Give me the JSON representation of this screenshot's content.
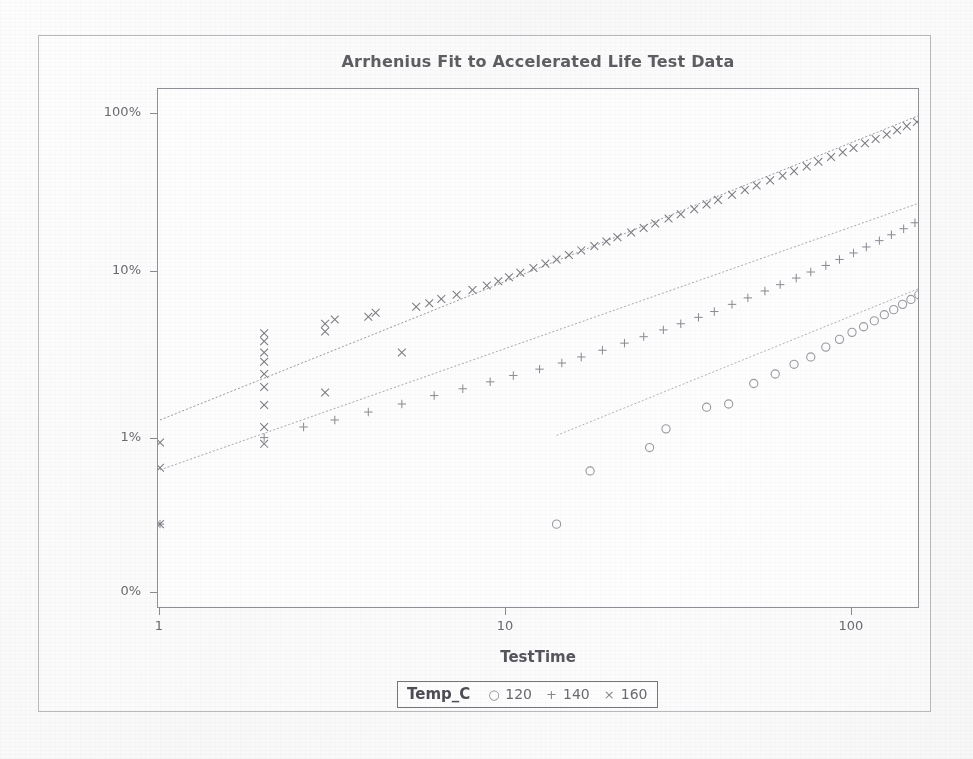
{
  "chart_data": {
    "type": "scatter",
    "title": "Arrhenius Fit to Accelerated Life Test Data",
    "xlabel": "TestTime",
    "ylabel": "Percent Failed",
    "xscale": "log",
    "yscale": "lognormal-probability",
    "xlim": [
      1,
      200
    ],
    "ylim_percent": [
      0.1,
      130
    ],
    "xticks": [
      "1",
      "10",
      "100"
    ],
    "xtick_values": [
      1,
      10,
      100
    ],
    "yticks": [
      "100%",
      "10%",
      "1%",
      "0%"
    ],
    "ytick_values": [
      100,
      10,
      1,
      0.1
    ],
    "grid": false,
    "legend_position": "bottom-center",
    "legend_title": "Temp_C",
    "series": [
      {
        "name": "120",
        "label": "120",
        "marker": "circle",
        "color": "#9a9aa0",
        "fit_line": {
          "x_start": 14.0,
          "y_start": 1.05,
          "x_end": 200.0,
          "y_end": 9.8
        },
        "points": [
          {
            "x": 14.0,
            "y": 0.28
          },
          {
            "x": 17.5,
            "y": 0.62
          },
          {
            "x": 26.0,
            "y": 0.88
          },
          {
            "x": 29.0,
            "y": 1.15
          },
          {
            "x": 38.0,
            "y": 1.55
          },
          {
            "x": 44.0,
            "y": 1.62
          },
          {
            "x": 52.0,
            "y": 2.15
          },
          {
            "x": 60.0,
            "y": 2.45
          },
          {
            "x": 68.0,
            "y": 2.8
          },
          {
            "x": 76.0,
            "y": 3.1
          },
          {
            "x": 84.0,
            "y": 3.55
          },
          {
            "x": 92.0,
            "y": 3.95
          },
          {
            "x": 100.0,
            "y": 4.35
          },
          {
            "x": 108.0,
            "y": 4.7
          },
          {
            "x": 116.0,
            "y": 5.1
          },
          {
            "x": 124.0,
            "y": 5.55
          },
          {
            "x": 132.0,
            "y": 5.95
          },
          {
            "x": 140.0,
            "y": 6.4
          },
          {
            "x": 148.0,
            "y": 6.85
          },
          {
            "x": 156.0,
            "y": 7.3
          },
          {
            "x": 163.0,
            "y": 7.7
          },
          {
            "x": 170.0,
            "y": 8.1
          },
          {
            "x": 177.0,
            "y": 8.5
          },
          {
            "x": 184.0,
            "y": 8.9
          },
          {
            "x": 190.0,
            "y": 9.25
          },
          {
            "x": 196.0,
            "y": 9.6
          }
        ]
      },
      {
        "name": "140",
        "label": "140",
        "marker": "plus",
        "color": "#8e8e95",
        "fit_line": {
          "x_start": 1.0,
          "y_start": 0.63,
          "x_end": 200.0,
          "y_end": 33.0
        },
        "points": [
          {
            "x": 1.0,
            "y": 0.28
          },
          {
            "x": 2.0,
            "y": 1.02
          },
          {
            "x": 2.6,
            "y": 1.18
          },
          {
            "x": 3.2,
            "y": 1.3
          },
          {
            "x": 4.0,
            "y": 1.45
          },
          {
            "x": 5.0,
            "y": 1.62
          },
          {
            "x": 6.2,
            "y": 1.82
          },
          {
            "x": 7.5,
            "y": 2.0
          },
          {
            "x": 9.0,
            "y": 2.2
          },
          {
            "x": 10.5,
            "y": 2.4
          },
          {
            "x": 12.5,
            "y": 2.62
          },
          {
            "x": 14.5,
            "y": 2.85
          },
          {
            "x": 16.5,
            "y": 3.1
          },
          {
            "x": 19.0,
            "y": 3.4
          },
          {
            "x": 22.0,
            "y": 3.75
          },
          {
            "x": 25.0,
            "y": 4.1
          },
          {
            "x": 28.5,
            "y": 4.5
          },
          {
            "x": 32.0,
            "y": 4.9
          },
          {
            "x": 36.0,
            "y": 5.35
          },
          {
            "x": 40.0,
            "y": 5.8
          },
          {
            "x": 45.0,
            "y": 6.4
          },
          {
            "x": 50.0,
            "y": 7.0
          },
          {
            "x": 56.0,
            "y": 7.7
          },
          {
            "x": 62.0,
            "y": 8.4
          },
          {
            "x": 69.0,
            "y": 9.2
          },
          {
            "x": 76.0,
            "y": 10.0
          },
          {
            "x": 84.0,
            "y": 11.0
          },
          {
            "x": 92.0,
            "y": 12.0
          },
          {
            "x": 101.0,
            "y": 13.2
          },
          {
            "x": 110.0,
            "y": 14.4
          },
          {
            "x": 120.0,
            "y": 15.8
          },
          {
            "x": 130.0,
            "y": 17.2
          },
          {
            "x": 141.0,
            "y": 18.8
          },
          {
            "x": 152.0,
            "y": 20.5
          },
          {
            "x": 163.0,
            "y": 22.3
          },
          {
            "x": 174.0,
            "y": 24.2
          },
          {
            "x": 185.0,
            "y": 26.2
          },
          {
            "x": 195.0,
            "y": 28.5
          },
          {
            "x": 200.0,
            "y": 31.0
          }
        ]
      },
      {
        "name": "160",
        "label": "160",
        "marker": "cross",
        "color": "#7b7b82",
        "fit_line": {
          "x_start": 1.0,
          "y_start": 1.3,
          "x_end": 200.0,
          "y_end": 110.0
        },
        "points": [
          {
            "x": 1.0,
            "y": 0.95
          },
          {
            "x": 1.0,
            "y": 0.65
          },
          {
            "x": 1.0,
            "y": 0.28
          },
          {
            "x": 2.0,
            "y": 0.93
          },
          {
            "x": 2.0,
            "y": 1.18
          },
          {
            "x": 2.0,
            "y": 1.6
          },
          {
            "x": 2.0,
            "y": 2.05
          },
          {
            "x": 2.0,
            "y": 2.45
          },
          {
            "x": 2.0,
            "y": 2.9
          },
          {
            "x": 2.0,
            "y": 3.3
          },
          {
            "x": 2.0,
            "y": 3.85
          },
          {
            "x": 2.0,
            "y": 4.3
          },
          {
            "x": 3.0,
            "y": 1.9
          },
          {
            "x": 3.0,
            "y": 4.4
          },
          {
            "x": 3.0,
            "y": 4.9
          },
          {
            "x": 3.2,
            "y": 5.2
          },
          {
            "x": 4.0,
            "y": 5.4
          },
          {
            "x": 4.2,
            "y": 5.7
          },
          {
            "x": 5.0,
            "y": 3.3
          },
          {
            "x": 5.5,
            "y": 6.2
          },
          {
            "x": 6.0,
            "y": 6.5
          },
          {
            "x": 6.5,
            "y": 6.9
          },
          {
            "x": 7.2,
            "y": 7.3
          },
          {
            "x": 8.0,
            "y": 7.8
          },
          {
            "x": 8.8,
            "y": 8.3
          },
          {
            "x": 9.5,
            "y": 8.8
          },
          {
            "x": 10.2,
            "y": 9.3
          },
          {
            "x": 11.0,
            "y": 9.9
          },
          {
            "x": 12.0,
            "y": 10.6
          },
          {
            "x": 13.0,
            "y": 11.3
          },
          {
            "x": 14.0,
            "y": 12.0
          },
          {
            "x": 15.2,
            "y": 12.8
          },
          {
            "x": 16.5,
            "y": 13.7
          },
          {
            "x": 18.0,
            "y": 14.6
          },
          {
            "x": 19.5,
            "y": 15.6
          },
          {
            "x": 21.0,
            "y": 16.6
          },
          {
            "x": 23.0,
            "y": 17.8
          },
          {
            "x": 25.0,
            "y": 19.0
          },
          {
            "x": 27.0,
            "y": 20.3
          },
          {
            "x": 29.5,
            "y": 21.8
          },
          {
            "x": 32.0,
            "y": 23.2
          },
          {
            "x": 35.0,
            "y": 25.0
          },
          {
            "x": 38.0,
            "y": 26.8
          },
          {
            "x": 41.0,
            "y": 28.6
          },
          {
            "x": 45.0,
            "y": 30.8
          },
          {
            "x": 49.0,
            "y": 33.0
          },
          {
            "x": 53.0,
            "y": 35.3
          },
          {
            "x": 58.0,
            "y": 38.0
          },
          {
            "x": 63.0,
            "y": 40.7
          },
          {
            "x": 68.0,
            "y": 43.5
          },
          {
            "x": 74.0,
            "y": 46.6
          },
          {
            "x": 80.0,
            "y": 49.8
          },
          {
            "x": 87.0,
            "y": 53.5
          },
          {
            "x": 94.0,
            "y": 57.2
          },
          {
            "x": 101.0,
            "y": 61.0
          },
          {
            "x": 109.0,
            "y": 65.3
          },
          {
            "x": 117.0,
            "y": 69.5
          },
          {
            "x": 126.0,
            "y": 74.2
          },
          {
            "x": 135.0,
            "y": 79.0
          },
          {
            "x": 144.0,
            "y": 83.8
          },
          {
            "x": 154.0,
            "y": 89.0
          },
          {
            "x": 164.0,
            "y": 94.2
          },
          {
            "x": 175.0,
            "y": 100.0
          },
          {
            "x": 186.0,
            "y": 105.5
          },
          {
            "x": 197.0,
            "y": 111.0
          }
        ]
      }
    ]
  },
  "legend": {
    "title": "Temp_C",
    "entries": [
      {
        "symbol": "○",
        "label": "120",
        "icon": "circle-marker-icon"
      },
      {
        "symbol": "+",
        "label": "140",
        "icon": "plus-marker-icon"
      },
      {
        "symbol": "×",
        "label": "160",
        "icon": "cross-marker-icon"
      }
    ]
  },
  "axes": {
    "x_title": "TestTime",
    "y_title": "Percent Failed",
    "x_tick_labels": [
      "1",
      "10",
      "100"
    ],
    "y_tick_labels": [
      "100%",
      "10%",
      "1%",
      "0%"
    ]
  },
  "colors": {
    "title": "#5d5d62",
    "axis": "#8f8f95",
    "text": "#6a6a70",
    "series_120": "#9a9aa0",
    "series_140": "#8e8e95",
    "series_160": "#7b7b82",
    "frame": "#b9b9bd",
    "background": "#ffffff"
  }
}
